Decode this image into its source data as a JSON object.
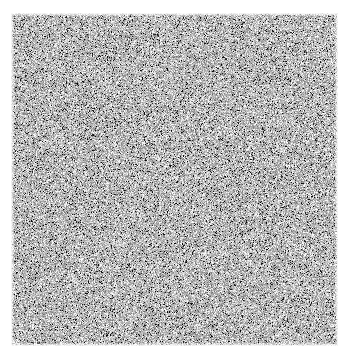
{
  "canvas": {
    "width": 353,
    "height": 358,
    "background_color": "#ffffff"
  },
  "noise_field": {
    "name": "random-grayscale-noise",
    "x": 11,
    "y": 13,
    "width": 327,
    "height": 333,
    "grain_size_px": 1,
    "color_mode": "grayscale",
    "min_gray": 0,
    "max_gray": 255,
    "mean_gray": 182,
    "std_gray": 62,
    "distribution": "uniform-skewed-light",
    "edge_falloff_px": 3,
    "seed": 20240517
  },
  "overlays": {
    "has_text": false,
    "has_border": false,
    "has_axes": false,
    "has_legend": false,
    "label": ""
  }
}
